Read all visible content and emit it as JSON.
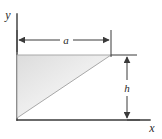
{
  "figure": {
    "type": "engineering-diagram",
    "background_color": "#ffffff",
    "line_color": "#3a3a3a",
    "shape_fill_light": "#f7f7f7",
    "shape_fill_dark": "#d9d9d9",
    "shape_stroke": "#9a9a9a",
    "axes": {
      "x_label": "x",
      "y_label": "y",
      "origin_x": 17,
      "origin_y": 120,
      "x_axis_end": 150,
      "y_axis_top": 14
    },
    "dimensions": [
      {
        "name": "base-dimension",
        "label": "a",
        "orientation": "horizontal",
        "from_x": 17,
        "to_x": 111,
        "line_y": 40
      },
      {
        "name": "height-dimension",
        "label": "h",
        "orientation": "vertical",
        "from_y": 55,
        "to_y": 120,
        "line_x": 127
      }
    ],
    "triangle": {
      "name": "triangular-region",
      "vertices": [
        {
          "x": 17,
          "y": 55
        },
        {
          "x": 111,
          "y": 55
        },
        {
          "x": 17,
          "y": 118
        }
      ],
      "right_angle_at": "top-left",
      "hypotenuse": "bottom-left to top-right"
    }
  }
}
